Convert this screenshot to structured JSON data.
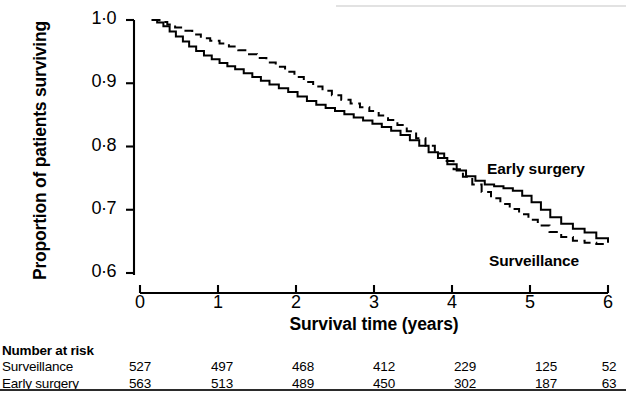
{
  "figure": {
    "caption_present": false
  },
  "axes": {
    "y_label": "Proportion of patients surviving",
    "x_label": "Survival time (years)",
    "y_ticks": [
      "1·0",
      "0·9",
      "0·8",
      "0·7",
      "0·6"
    ],
    "x_ticks": [
      "0",
      "1",
      "2",
      "3",
      "4",
      "5",
      "6"
    ]
  },
  "series_labels": {
    "early_surgery": "Early surgery",
    "surveillance": "Surveillance"
  },
  "risk_table": {
    "title": "Number at risk",
    "rows": [
      {
        "label": "Surveillance",
        "values": [
          "527",
          "497",
          "468",
          "412",
          "229",
          "125",
          "52"
        ]
      },
      {
        "label": "Early surgery",
        "values": [
          "563",
          "513",
          "489",
          "450",
          "302",
          "187",
          "63"
        ]
      }
    ]
  },
  "chart_data": {
    "type": "line",
    "title": "",
    "subtitle": "",
    "xlabel": "Survival time (years)",
    "ylabel": "Proportion of patients surviving",
    "xlim": [
      0,
      6
    ],
    "ylim": [
      0.6,
      1.0
    ],
    "xticks": [
      0,
      1,
      2,
      3,
      4,
      5,
      6
    ],
    "yticks": [
      0.6,
      0.7,
      0.8,
      0.9,
      1.0
    ],
    "grid": false,
    "legend_position": "inline-annotations",
    "style": "kaplan-meier-step",
    "annotations": [
      {
        "text": "Early surgery",
        "x": 5.05,
        "y": 0.782
      },
      {
        "text": "Surveillance",
        "x": 5.07,
        "y": 0.636
      }
    ],
    "series": [
      {
        "name": "Early surgery",
        "line_style": "solid",
        "color": "#000000",
        "x": [
          0.15,
          0.22,
          0.3,
          0.38,
          0.46,
          0.55,
          0.63,
          0.72,
          0.82,
          0.92,
          1.02,
          1.12,
          1.22,
          1.33,
          1.44,
          1.55,
          1.66,
          1.78,
          1.9,
          2.02,
          2.14,
          2.26,
          2.38,
          2.5,
          2.62,
          2.74,
          2.86,
          2.98,
          3.1,
          3.22,
          3.34,
          3.46,
          3.58,
          3.7,
          3.82,
          3.94,
          4.06,
          4.18,
          4.3,
          4.42,
          4.54,
          4.66,
          4.78,
          4.9,
          5.02,
          5.14,
          5.26,
          5.4,
          5.55,
          5.7,
          5.85,
          6.0
        ],
        "y": [
          1.0,
          0.996,
          0.99,
          0.982,
          0.974,
          0.966,
          0.958,
          0.951,
          0.944,
          0.938,
          0.932,
          0.927,
          0.922,
          0.916,
          0.91,
          0.904,
          0.898,
          0.892,
          0.886,
          0.879,
          0.872,
          0.866,
          0.861,
          0.856,
          0.851,
          0.846,
          0.841,
          0.836,
          0.831,
          0.825,
          0.818,
          0.81,
          0.801,
          0.791,
          0.782,
          0.772,
          0.762,
          0.753,
          0.746,
          0.74,
          0.737,
          0.734,
          0.73,
          0.722,
          0.712,
          0.7,
          0.688,
          0.678,
          0.67,
          0.664,
          0.655,
          0.648
        ]
      },
      {
        "name": "Surveillance",
        "line_style": "dashed",
        "color": "#000000",
        "x": [
          0.15,
          0.25,
          0.35,
          0.45,
          0.56,
          0.67,
          0.78,
          0.9,
          1.02,
          1.14,
          1.26,
          1.38,
          1.5,
          1.62,
          1.74,
          1.86,
          1.98,
          2.1,
          2.22,
          2.34,
          2.46,
          2.58,
          2.7,
          2.82,
          2.94,
          3.06,
          3.18,
          3.3,
          3.42,
          3.54,
          3.66,
          3.78,
          3.9,
          4.02,
          4.14,
          4.26,
          4.38,
          4.5,
          4.62,
          4.74,
          4.86,
          4.98,
          5.1,
          5.25,
          5.4,
          5.55,
          5.7,
          5.85,
          6.0
        ],
        "y": [
          1.0,
          0.997,
          0.993,
          0.988,
          0.983,
          0.977,
          0.971,
          0.967,
          0.963,
          0.958,
          0.952,
          0.946,
          0.94,
          0.933,
          0.926,
          0.918,
          0.91,
          0.902,
          0.895,
          0.888,
          0.881,
          0.874,
          0.868,
          0.862,
          0.856,
          0.849,
          0.842,
          0.834,
          0.824,
          0.813,
          0.801,
          0.789,
          0.777,
          0.764,
          0.752,
          0.74,
          0.728,
          0.718,
          0.709,
          0.701,
          0.693,
          0.684,
          0.675,
          0.665,
          0.657,
          0.651,
          0.648,
          0.646,
          0.645
        ]
      }
    ]
  }
}
